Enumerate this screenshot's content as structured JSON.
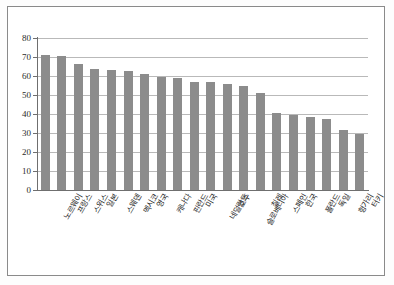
{
  "chart_data": {
    "type": "bar",
    "title": "",
    "xlabel": "",
    "ylabel": "",
    "ylim": [
      0,
      80
    ],
    "ytick_step": 10,
    "grid": true,
    "legend": false,
    "legend_position": "none",
    "bar_color": "#8c8c8c",
    "categories": [
      "노르웨이",
      "프랑스",
      "스위스",
      "일본",
      "스웨덴",
      "멕시코",
      "영국",
      "캐나다",
      "핀란드",
      "미국",
      "네덜란드",
      "호주",
      "슬로베니아",
      "칠레",
      "스페인",
      "한국",
      "폴란드",
      "독일",
      "헝가리",
      "터키"
    ],
    "values": [
      71.2,
      70.6,
      66.3,
      63.8,
      63.3,
      62.6,
      61.2,
      59.5,
      58.7,
      56.8,
      56.7,
      55.7,
      54.8,
      51.2,
      40.6,
      39.5,
      38.5,
      37.5,
      31.4,
      29.4
    ],
    "ytick_labels": [
      "0",
      "10",
      "20",
      "30",
      "40",
      "50",
      "60",
      "70",
      "80"
    ]
  }
}
